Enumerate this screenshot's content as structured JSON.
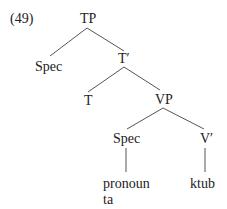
{
  "example_number": "(49)",
  "tree": {
    "root": "TP",
    "nodes": {
      "tp": "TP",
      "tp_spec": "Spec",
      "t_bar": "T′",
      "t_head": "T",
      "vp": "VP",
      "vp_spec": "Spec",
      "v_bar": "V′",
      "pronoun_line1": "pronoun",
      "pronoun_line2": "ta",
      "verb": "ktub"
    },
    "edges": [
      [
        "TP",
        "Spec"
      ],
      [
        "TP",
        "T′"
      ],
      [
        "T′",
        "T"
      ],
      [
        "T′",
        "VP"
      ],
      [
        "VP",
        "Spec"
      ],
      [
        "VP",
        "V′"
      ],
      [
        "Spec",
        "pronoun ta"
      ],
      [
        "V′",
        "ktub"
      ]
    ]
  }
}
